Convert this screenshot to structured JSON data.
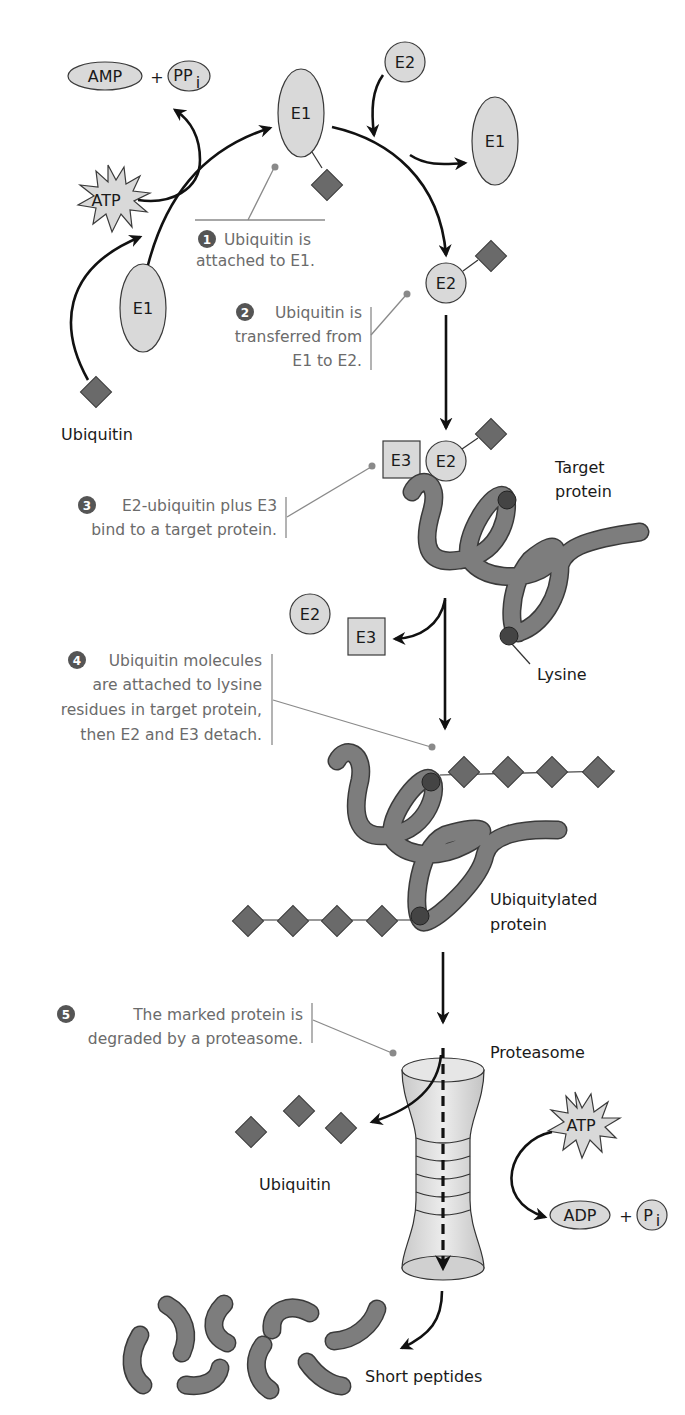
{
  "molecules": {
    "amp": "AMP",
    "ppi_base": "PP",
    "ppi_sub": "i",
    "plus": "+",
    "atp_top": "ATP",
    "atp_bottom": "ATP",
    "adp": "ADP",
    "pi_base": "P",
    "pi_sub": "i"
  },
  "enzymes": {
    "e1_left": "E1",
    "e1_top": "E1",
    "e1_released": "E1",
    "e2_incoming": "E2",
    "e2_loaded": "E2",
    "e2_complex": "E2",
    "e3_complex": "E3",
    "e2_released": "E2",
    "e3_released": "E3"
  },
  "labels": {
    "ubiquitin_start": "Ubiquitin",
    "target_protein_line1": "Target",
    "target_protein_line2": "protein",
    "lysine": "Lysine",
    "ubiquitylated_line1": "Ubiquitylated",
    "ubiquitylated_line2": "protein",
    "proteasome": "Proteasome",
    "ubiquitin_released": "Ubiquitin",
    "short_peptides": "Short peptides"
  },
  "steps": [
    {
      "number": "1",
      "lines": [
        "Ubiquitin is",
        "attached to E1."
      ]
    },
    {
      "number": "2",
      "lines": [
        "Ubiquitin is",
        "transferred from",
        "E1 to E2."
      ]
    },
    {
      "number": "3",
      "lines": [
        "E2-ubiquitin plus E3",
        "bind to a target protein."
      ]
    },
    {
      "number": "4",
      "lines": [
        "Ubiquitin molecules",
        "are attached to lysine",
        "residues in target protein,",
        "then E2 and E3 detach."
      ]
    },
    {
      "number": "5",
      "lines": [
        "The marked protein is",
        "degraded by a proteasome."
      ]
    }
  ],
  "colors": {
    "enzyme_fill": "#d9d9d9",
    "ubiquitin_fill": "#6a6a6a",
    "protein_fill": "#7d7d7d",
    "lysine_fill": "#444444",
    "step_text": "#6b6b6b",
    "step_badge": "#555555",
    "arrow": "#111111"
  }
}
